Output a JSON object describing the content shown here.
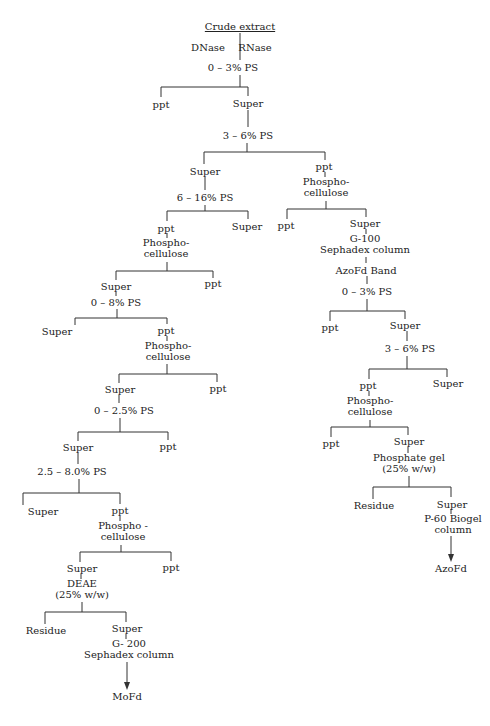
{
  "diagram": {
    "type": "purification-flowchart",
    "root": "Crude extract",
    "nodes": [
      {
        "id": "crude",
        "text": "Crude extract",
        "x": 240,
        "y": 21,
        "underline": true
      },
      {
        "id": "dnase",
        "text": "DNase",
        "x": 208,
        "y": 42
      },
      {
        "id": "rnase",
        "text": "RNase",
        "x": 255,
        "y": 42
      },
      {
        "id": "ps0_3",
        "text": "0 – 3% PS",
        "x": 233,
        "y": 62
      },
      {
        "id": "ppt1",
        "text": "ppt",
        "x": 161,
        "y": 99
      },
      {
        "id": "super1",
        "text": "Super",
        "x": 248,
        "y": 98
      },
      {
        "id": "ps3_6",
        "text": "3 – 6% PS",
        "x": 248,
        "y": 130
      },
      {
        "id": "super2",
        "text": "Super",
        "x": 205,
        "y": 166
      },
      {
        "id": "ps6_16",
        "text": "6 – 16% PS",
        "x": 205,
        "y": 192
      },
      {
        "id": "ppt3",
        "text": "ppt",
        "x": 166,
        "y": 223
      },
      {
        "id": "super3",
        "text": "Super",
        "x": 247,
        "y": 221
      },
      {
        "id": "pc1",
        "text": "Phospho-\ncellulose",
        "x": 166,
        "y": 237
      },
      {
        "id": "super4",
        "text": "Super",
        "x": 116,
        "y": 281
      },
      {
        "id": "ppt4",
        "text": "ppt",
        "x": 213,
        "y": 278
      },
      {
        "id": "ps0_8",
        "text": "0 – 8% PS",
        "x": 116,
        "y": 297
      },
      {
        "id": "super5",
        "text": "Super",
        "x": 57,
        "y": 326
      },
      {
        "id": "ppt5",
        "text": "ppt",
        "x": 166,
        "y": 325
      },
      {
        "id": "pc2",
        "text": "Phospho-\ncellulose",
        "x": 168,
        "y": 340
      },
      {
        "id": "super6",
        "text": "Super",
        "x": 120,
        "y": 384
      },
      {
        "id": "ppt6",
        "text": "ppt",
        "x": 218,
        "y": 383
      },
      {
        "id": "ps0_2_5",
        "text": "0 – 2.5% PS",
        "x": 124,
        "y": 405
      },
      {
        "id": "super7",
        "text": "Super",
        "x": 78,
        "y": 442
      },
      {
        "id": "ppt7",
        "text": "ppt",
        "x": 168,
        "y": 441
      },
      {
        "id": "ps2_5_8",
        "text": "2.5 – 8.0% PS",
        "x": 72,
        "y": 466
      },
      {
        "id": "super8",
        "text": "Super",
        "x": 43,
        "y": 506
      },
      {
        "id": "ppt8",
        "text": "ppt",
        "x": 120,
        "y": 505
      },
      {
        "id": "pc3",
        "text": "Phospho -\ncellulose",
        "x": 123,
        "y": 520
      },
      {
        "id": "super9",
        "text": "Super",
        "x": 82,
        "y": 563
      },
      {
        "id": "ppt9",
        "text": "ppt",
        "x": 171,
        "y": 562
      },
      {
        "id": "deae",
        "text": "DEAE\n(25% w/w)",
        "x": 82,
        "y": 578
      },
      {
        "id": "residue1",
        "text": "Residue",
        "x": 46,
        "y": 625
      },
      {
        "id": "super10",
        "text": "Super",
        "x": 127,
        "y": 623
      },
      {
        "id": "g200",
        "text": "G- 200\nSephadex column",
        "x": 129,
        "y": 638
      },
      {
        "id": "mofd",
        "text": "MoFd",
        "x": 127,
        "y": 691
      },
      {
        "id": "ppt2",
        "text": "ppt",
        "x": 324,
        "y": 161
      },
      {
        "id": "pc4",
        "text": "Phospho-\ncellulose",
        "x": 326,
        "y": 176
      },
      {
        "id": "ppt10",
        "text": "ppt",
        "x": 286,
        "y": 220
      },
      {
        "id": "super11",
        "text": "Super",
        "x": 365,
        "y": 218
      },
      {
        "id": "g100",
        "text": "G-100\nSephadex column",
        "x": 365,
        "y": 233
      },
      {
        "id": "azofd_band",
        "text": "AzoFd  Band",
        "x": 366,
        "y": 265
      },
      {
        "id": "ps0_3b",
        "text": "0 – 3% PS",
        "x": 367,
        "y": 286
      },
      {
        "id": "ppt11",
        "text": "ppt",
        "x": 330,
        "y": 322
      },
      {
        "id": "super12",
        "text": "Super",
        "x": 405,
        "y": 320
      },
      {
        "id": "ps3_6b",
        "text": "3 – 6% PS",
        "x": 410,
        "y": 343
      },
      {
        "id": "ppt12",
        "text": "ppt",
        "x": 368,
        "y": 380
      },
      {
        "id": "super13",
        "text": "Super",
        "x": 448,
        "y": 378
      },
      {
        "id": "pc5",
        "text": "Phospho-\ncellulose",
        "x": 370,
        "y": 395
      },
      {
        "id": "ppt13",
        "text": "ppt",
        "x": 331,
        "y": 438
      },
      {
        "id": "super14",
        "text": "Super",
        "x": 409,
        "y": 436
      },
      {
        "id": "phosgel",
        "text": "Phosphate gel\n(25% w/w)",
        "x": 409,
        "y": 452
      },
      {
        "id": "residue2",
        "text": "Residue",
        "x": 374,
        "y": 500
      },
      {
        "id": "super15",
        "text": "Super",
        "x": 452,
        "y": 499
      },
      {
        "id": "p60",
        "text": "P-60  Biogel\ncolumn",
        "x": 453,
        "y": 513
      },
      {
        "id": "azofd",
        "text": "AzoFd",
        "x": 451,
        "y": 563
      }
    ],
    "products": [
      "MoFd",
      "AzoFd"
    ]
  }
}
